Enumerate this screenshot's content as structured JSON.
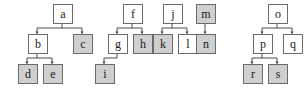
{
  "diagram": {
    "type": "tree-forest",
    "canvas": {
      "width": 308,
      "height": 94,
      "background": "#ffffff"
    },
    "style": {
      "node_fill_plain": "#ffffff",
      "node_fill_shaded": "#cfcfcf",
      "node_border": "#6b6b6b",
      "edge_color": "#4d4d4d",
      "label_color": "#1a1a1a"
    },
    "node_size": {
      "width": 18,
      "height": 18
    },
    "nodes": [
      {
        "id": "a",
        "label": "a",
        "shaded": false,
        "x": 53,
        "y": 4,
        "row": 0,
        "tree": 1
      },
      {
        "id": "b",
        "label": "b",
        "shaded": false,
        "x": 28,
        "y": 34,
        "row": 1,
        "tree": 1
      },
      {
        "id": "c",
        "label": "c",
        "shaded": true,
        "x": 73,
        "y": 34,
        "row": 1,
        "tree": 1
      },
      {
        "id": "d",
        "label": "d",
        "shaded": true,
        "x": 18,
        "y": 64,
        "row": 2,
        "tree": 1
      },
      {
        "id": "e",
        "label": "e",
        "shaded": true,
        "x": 43,
        "y": 64,
        "row": 2,
        "tree": 1
      },
      {
        "id": "f",
        "label": "f",
        "shaded": false,
        "x": 123,
        "y": 4,
        "row": 0,
        "tree": 2
      },
      {
        "id": "g",
        "label": "g",
        "shaded": false,
        "x": 108,
        "y": 34,
        "row": 1,
        "tree": 2
      },
      {
        "id": "h",
        "label": "h",
        "shaded": true,
        "x": 133,
        "y": 34,
        "row": 1,
        "tree": 2
      },
      {
        "id": "i",
        "label": "i",
        "shaded": true,
        "x": 95,
        "y": 64,
        "row": 2,
        "tree": 2
      },
      {
        "id": "j",
        "label": "j",
        "shaded": false,
        "x": 163,
        "y": 4,
        "row": 0,
        "tree": 3
      },
      {
        "id": "k",
        "label": "k",
        "shaded": true,
        "x": 153,
        "y": 34,
        "row": 1,
        "tree": 3
      },
      {
        "id": "l",
        "label": "l",
        "shaded": false,
        "x": 178,
        "y": 34,
        "row": 1,
        "tree": 3
      },
      {
        "id": "m",
        "label": "m",
        "shaded": true,
        "x": 196,
        "y": 4,
        "row": 0,
        "tree": 4
      },
      {
        "id": "n",
        "label": "n",
        "shaded": true,
        "x": 196,
        "y": 34,
        "row": 1,
        "tree": 4
      },
      {
        "id": "o",
        "label": "o",
        "shaded": false,
        "x": 268,
        "y": 4,
        "row": 0,
        "tree": 5
      },
      {
        "id": "p",
        "label": "p",
        "shaded": false,
        "x": 253,
        "y": 34,
        "row": 1,
        "tree": 5
      },
      {
        "id": "q",
        "label": "q",
        "shaded": false,
        "x": 283,
        "y": 34,
        "row": 1,
        "tree": 5
      },
      {
        "id": "r",
        "label": "r",
        "shaded": true,
        "x": 243,
        "y": 64,
        "row": 2,
        "tree": 5
      },
      {
        "id": "s",
        "label": "s",
        "shaded": true,
        "x": 268,
        "y": 64,
        "row": 2,
        "tree": 5
      }
    ],
    "edges": [
      {
        "from": "a",
        "to": "b"
      },
      {
        "from": "a",
        "to": "c"
      },
      {
        "from": "b",
        "to": "d"
      },
      {
        "from": "b",
        "to": "e"
      },
      {
        "from": "f",
        "to": "g"
      },
      {
        "from": "f",
        "to": "h"
      },
      {
        "from": "g",
        "to": "i"
      },
      {
        "from": "j",
        "to": "k"
      },
      {
        "from": "j",
        "to": "l"
      },
      {
        "from": "m",
        "to": "n"
      },
      {
        "from": "o",
        "to": "p"
      },
      {
        "from": "o",
        "to": "q"
      },
      {
        "from": "p",
        "to": "r"
      },
      {
        "from": "p",
        "to": "s"
      }
    ]
  }
}
